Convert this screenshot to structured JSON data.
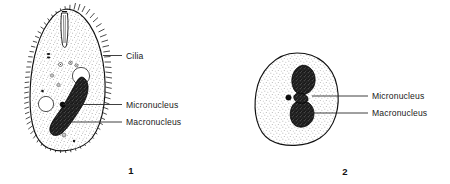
{
  "figure": {
    "background_color": "#ffffff",
    "ink_color": "#111111",
    "label_text_color": "#1a1a1a"
  },
  "organism_1": {
    "number": "1",
    "labels": {
      "cilia": "Cilia",
      "micronucleus": "Micronucleus",
      "macronucleus": "Macronucleus"
    },
    "parts": [
      "cilia",
      "oral-groove",
      "cytoplasm",
      "contractile-vacuole",
      "food-vacuole",
      "micronucleus",
      "macronucleus"
    ]
  },
  "organism_2": {
    "number": "2",
    "labels": {
      "micronucleus": "Micronucleus",
      "macronucleus": "Macronucleus"
    },
    "parts": [
      "cytoplasm",
      "micronucleus",
      "macronucleus"
    ]
  }
}
